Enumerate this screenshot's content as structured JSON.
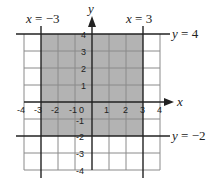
{
  "diagram": {
    "type": "coordinate-plane-region",
    "x_axis_label": "x",
    "y_axis_label": "y",
    "x_ticks": [
      "-4",
      "-3",
      "-2",
      "-1",
      "0",
      "1",
      "2",
      "3",
      "4"
    ],
    "y_ticks": [
      "4",
      "3",
      "2",
      "1",
      "-1",
      "-2",
      "-3",
      "-4"
    ],
    "boundary_lines": {
      "left": {
        "var": "x",
        "eq": "=",
        "val": "−3"
      },
      "right": {
        "var": "x",
        "eq": "=",
        "val": "3"
      },
      "top": {
        "var": "y",
        "eq": "=",
        "val": "4"
      },
      "bottom": {
        "var": "y",
        "eq": "=",
        "val": "−2"
      }
    },
    "shaded_region": {
      "x_min": -3,
      "x_max": 3,
      "y_min": -2,
      "y_max": 4
    },
    "colors": {
      "shade": "#b3b3b3",
      "grid": "#8a8a8a",
      "axis": "#222222"
    }
  }
}
